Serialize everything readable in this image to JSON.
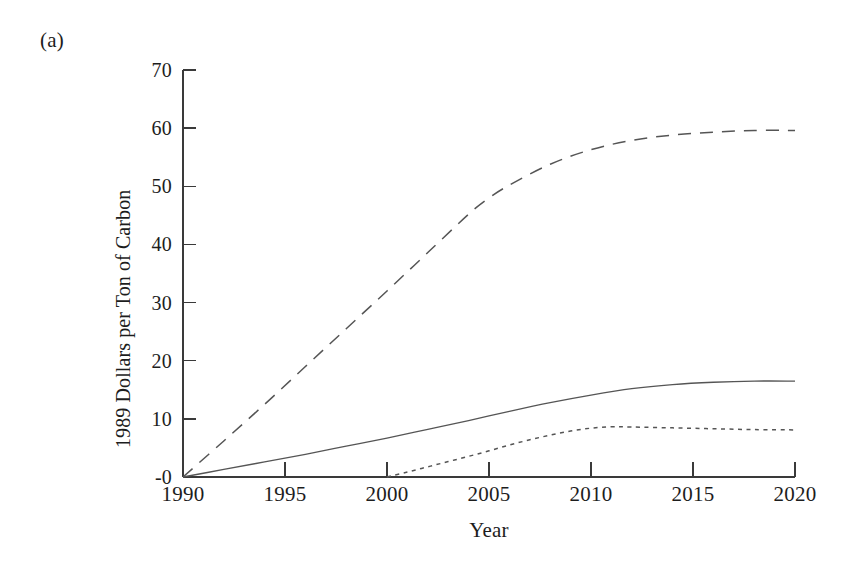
{
  "figure": {
    "panel_label": "(a)",
    "background_color": "#ffffff",
    "line_color": "#555555",
    "axis_color": "#3a3a3a"
  },
  "chart_data": {
    "type": "line",
    "title": "(a)",
    "xlabel": "Year",
    "ylabel": "1989 Dollars per Ton of Carbon",
    "xlim": [
      1990,
      2020
    ],
    "ylim": [
      0,
      70
    ],
    "xticks": [
      1990,
      1995,
      2000,
      2005,
      2010,
      2015,
      2020
    ],
    "xtick_labels": [
      "1990",
      "1995",
      "2000",
      "2005",
      "2010",
      "2015",
      "2020"
    ],
    "yticks": [
      0,
      10,
      20,
      30,
      40,
      50,
      60,
      70
    ],
    "ytick_labels": [
      "-0",
      "10",
      "20",
      "30",
      "40",
      "50",
      "60",
      "70"
    ],
    "grid": false,
    "legend": "none",
    "series": [
      {
        "name": "dashed-upper",
        "style": "dashed",
        "x": [
          1990,
          1992,
          1994,
          1996,
          1998,
          2000,
          2002,
          2004,
          2005,
          2006,
          2008,
          2010,
          2012,
          2014,
          2016,
          2018,
          2020
        ],
        "values": [
          0,
          6.2,
          12.5,
          19.0,
          25.5,
          32.0,
          38.6,
          45.2,
          48.0,
          50.2,
          53.8,
          56.3,
          57.9,
          58.8,
          59.3,
          59.6,
          59.6
        ]
      },
      {
        "name": "solid-middle",
        "style": "solid",
        "x": [
          1990,
          1992,
          1994,
          1996,
          1998,
          2000,
          2002,
          2004,
          2006,
          2008,
          2010,
          2012,
          2014,
          2016,
          2018,
          2020
        ],
        "values": [
          0,
          1.3,
          2.6,
          3.9,
          5.3,
          6.7,
          8.2,
          9.7,
          11.3,
          12.8,
          14.1,
          15.2,
          15.9,
          16.3,
          16.5,
          16.5
        ]
      },
      {
        "name": "dotted-lower",
        "style": "dotted",
        "x": [
          2000,
          2001,
          2002,
          2003,
          2004,
          2005,
          2006,
          2007,
          2008,
          2009,
          2010,
          2011,
          2012,
          2014,
          2016,
          2018,
          2020
        ],
        "values": [
          0,
          0.85,
          1.75,
          2.65,
          3.55,
          4.5,
          5.5,
          6.4,
          7.2,
          7.9,
          8.4,
          8.65,
          8.6,
          8.45,
          8.3,
          8.15,
          8.1
        ]
      }
    ]
  }
}
